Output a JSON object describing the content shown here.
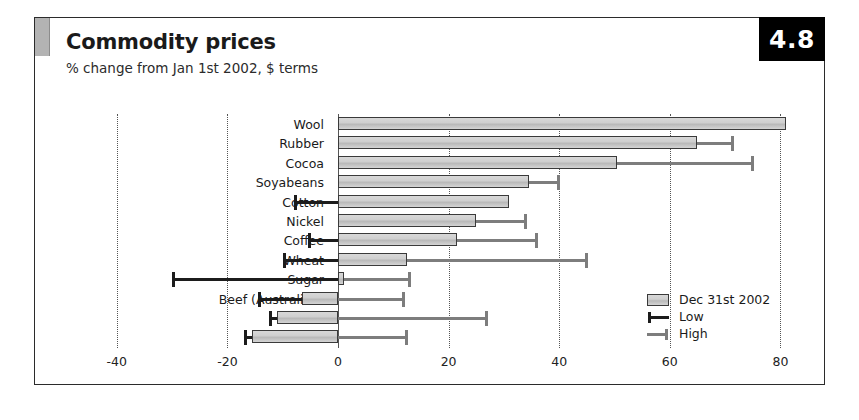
{
  "figure": {
    "number_badge": "4.8",
    "title": "Commodity prices",
    "subtitle": "% change from Jan 1st 2002, $ terms"
  },
  "legend": {
    "position": "inside-bottom-right",
    "items": [
      {
        "label": "Dec 31st 2002",
        "marker": "bar-swatch",
        "color": "#c9c9c9"
      },
      {
        "label": "Low",
        "marker": "whisker-left",
        "color": "#1c1c1c"
      },
      {
        "label": "High",
        "marker": "whisker-right",
        "color": "#7d7d7d"
      }
    ]
  },
  "chart_data": {
    "type": "bar",
    "orientation": "horizontal",
    "title": "Commodity prices",
    "subtitle": "% change from Jan 1st 2002, $ terms",
    "xlabel": "",
    "ylabel": "",
    "xlim": [
      -47,
      88
    ],
    "xticks": [
      -40,
      -20,
      0,
      20,
      40,
      60,
      80
    ],
    "xtick_labels": [
      "-40",
      "-20",
      "0",
      "20",
      "40",
      "60",
      "80"
    ],
    "grid": "vertical-dotted",
    "zero_line": 0,
    "categories": [
      "Wool",
      "Rubber",
      "Cocoa",
      "Soyabeans",
      "Cotton",
      "Nickel",
      "Coffee",
      "Wheat",
      "Sugar",
      "Beef (Australian)",
      "Timber",
      "Lead"
    ],
    "series": [
      {
        "name": "Dec 31st 2002",
        "values": [
          81.0,
          65.0,
          50.5,
          34.5,
          31.0,
          25.0,
          21.5,
          12.5,
          1.0,
          -6.5,
          -11.0,
          -15.5
        ]
      },
      {
        "name": "Low",
        "values": [
          0.0,
          0.0,
          0.0,
          0.0,
          -8.0,
          0.0,
          -5.5,
          -10.0,
          -30.0,
          -14.5,
          -12.5,
          -17.0
        ]
      },
      {
        "name": "High",
        "values": [
          81.0,
          71.5,
          75.0,
          40.0,
          31.0,
          34.0,
          36.0,
          45.0,
          13.0,
          12.0,
          27.0,
          12.5
        ]
      }
    ]
  }
}
